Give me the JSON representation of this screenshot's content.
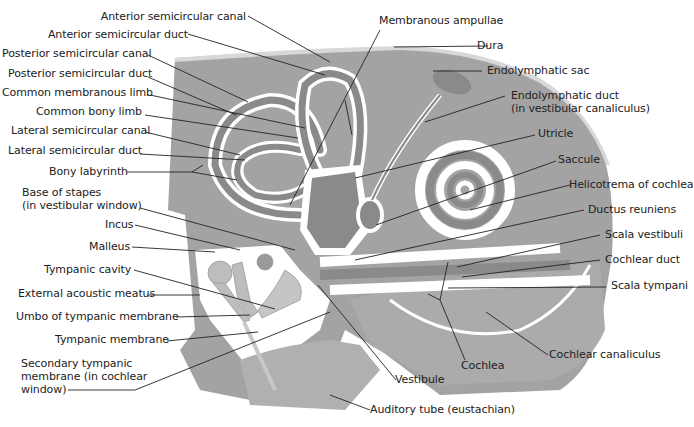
{
  "colors": {
    "background": "#ffffff",
    "bone": "#a3a3a3",
    "bone_light": "#b8b8b8",
    "membranous": "#8a8a8a",
    "perilymph_space": "#ffffff",
    "dura": "#d0d0d0",
    "ossicle": "#bdbdbd",
    "leader_line": "#222222",
    "text": "#222222"
  },
  "labels_left": [
    {
      "id": "anterior-semicircular-canal",
      "text": "Anterior semicircular canal"
    },
    {
      "id": "anterior-semicircular-duct",
      "text": "Anterior semicircular duct"
    },
    {
      "id": "posterior-semicircular-canal",
      "text": "Posterior semicircular canal"
    },
    {
      "id": "posterior-semicircular-duct",
      "text": "Posterior semicircular duct"
    },
    {
      "id": "common-membranous-limb",
      "text": "Common membranous limb"
    },
    {
      "id": "common-bony-limb",
      "text": "Common bony limb"
    },
    {
      "id": "lateral-semicircular-canal",
      "text": "Lateral semicircular canal"
    },
    {
      "id": "lateral-semicircular-duct",
      "text": "Lateral semicircular duct"
    },
    {
      "id": "bony-labyrinth",
      "text": "Bony labyrinth"
    },
    {
      "id": "base-of-stapes",
      "text": "Base of stapes",
      "text2": "(in vestibular window)"
    },
    {
      "id": "incus",
      "text": "Incus"
    },
    {
      "id": "malleus",
      "text": "Malleus"
    },
    {
      "id": "tympanic-cavity",
      "text": "Tympanic cavity"
    },
    {
      "id": "external-acoustic-meatus",
      "text": "External acoustic meatus"
    },
    {
      "id": "umbo",
      "text": "Umbo of tympanic membrane"
    },
    {
      "id": "tympanic-membrane",
      "text": "Tympanic membrane"
    },
    {
      "id": "secondary-tympanic-membrane",
      "text": "Secondary tympanic",
      "text2": "membrane (in cochlear",
      "text3": "window)"
    }
  ],
  "labels_right": [
    {
      "id": "membranous-ampullae",
      "text": "Membranous ampullae"
    },
    {
      "id": "dura",
      "text": "Dura"
    },
    {
      "id": "endolymphatic-sac",
      "text": "Endolymphatic sac"
    },
    {
      "id": "endolymphatic-duct",
      "text": "Endolymphatic duct",
      "text2": "(in vestibular canaliculus)"
    },
    {
      "id": "utricle",
      "text": "Utricle"
    },
    {
      "id": "saccule",
      "text": "Saccule"
    },
    {
      "id": "helicotrema",
      "text": "Helicotrema of cochlea"
    },
    {
      "id": "ductus-reuniens",
      "text": "Ductus reuniens"
    },
    {
      "id": "scala-vestibuli",
      "text": "Scala vestibuli"
    },
    {
      "id": "cochlear-duct",
      "text": "Cochlear duct"
    },
    {
      "id": "scala-tympani",
      "text": "Scala tympani"
    },
    {
      "id": "cochlear-canaliculus",
      "text": "Cochlear canaliculus"
    },
    {
      "id": "cochlea",
      "text": "Cochlea"
    },
    {
      "id": "vestibule",
      "text": "Vestibule"
    },
    {
      "id": "auditory-tube",
      "text": "Auditory tube (eustachian)"
    }
  ]
}
